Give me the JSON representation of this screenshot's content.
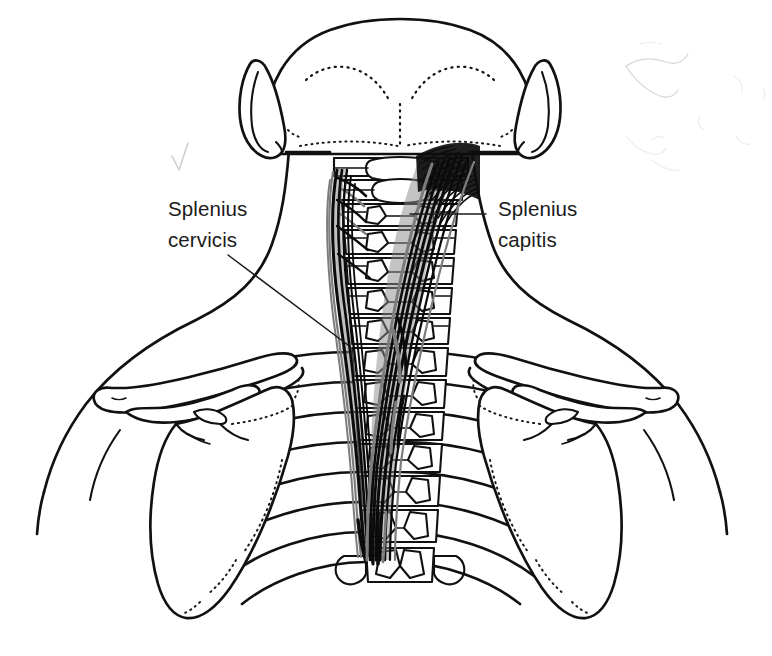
{
  "figure": {
    "view": "posterior",
    "background_color": "#ffffff",
    "ink_color": "#111111",
    "muscle_dark_color": "#0b0b0b",
    "muscle_shade_color": "#8a8a8a",
    "label_color": "#1b1b1b",
    "width": 772,
    "height": 656
  },
  "labels": {
    "left": {
      "line1": "Splenius",
      "line2": "cervicis",
      "x": 168,
      "y": 216,
      "leader_from_x": 228,
      "leader_from_y": 255,
      "leader_to_x": 348,
      "leader_to_y": 345
    },
    "right": {
      "line1": "Splenius",
      "line2": "capitis",
      "x": 498,
      "y": 216,
      "leader_from_x": 486,
      "leader_from_y": 214,
      "leader_to_x": 410,
      "leader_to_y": 214
    }
  },
  "structures": {
    "skull": "occiput-posterior",
    "ear_left": "auricle-left",
    "ear_right": "auricle-right",
    "nuchal_lines": "superior-nuchal-line-dotted",
    "cervical_vertebrae": "C1-C7",
    "thoracic_vertebrae": "T1-T6",
    "ribs": "posterior-ribs",
    "scapula_left": "scapula-left",
    "scapula_right": "scapula-right",
    "clavicle_left": "clavicle-left",
    "clavicle_right": "clavicle-right",
    "body_outline": "neck-shoulder-contour",
    "muscle_capitis": "splenius-capitis-fiber-band",
    "muscle_cervicis": "splenius-cervicis-fiber-band"
  },
  "artifacts": {
    "checkmark": "faint-grey-checkmark-scan-mark",
    "corner_smudges": "faint-scan-smudges-top-right"
  }
}
